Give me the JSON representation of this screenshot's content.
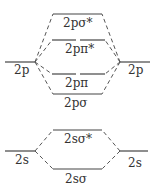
{
  "diagram": {
    "atomic_orbitals": {
      "left_2p": "2p",
      "right_2p": "2p",
      "left_2s": "2s",
      "right_2s": "2s"
    },
    "molecular_orbitals": {
      "sigma_2p_star": "2pσ*",
      "pi_2p_star": "2pπ*",
      "pi_2p": "2pπ",
      "sigma_2p": "2pσ",
      "sigma_2s_star": "2sσ*",
      "sigma_2s": "2sσ"
    },
    "colors": {
      "line": "#444444",
      "text": "#333333",
      "background": "#ffffff"
    }
  }
}
